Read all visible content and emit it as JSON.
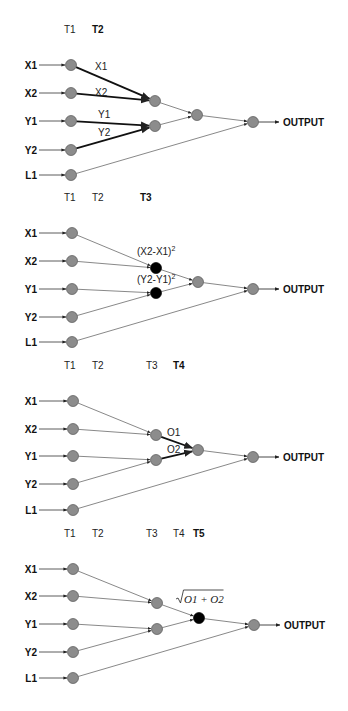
{
  "diagram": {
    "title": "",
    "colors": {
      "node_gray": "#8c8c8c",
      "node_black": "#000000",
      "edge": "#555555",
      "edge_bold": "#111111"
    },
    "input_labels": [
      "X1",
      "X2",
      "Y1",
      "Y2",
      "L1"
    ],
    "output_label": "OUTPUT",
    "panels": [
      {
        "id": "panel-1",
        "time_labels": [
          {
            "text": "T1",
            "x": 64,
            "y": 33,
            "bold": false
          },
          {
            "text": "T2",
            "x": 92,
            "y": 33,
            "bold": true
          }
        ],
        "inputs": [
          {
            "label": "X1",
            "y": 65
          },
          {
            "label": "X2",
            "y": 93
          },
          {
            "label": "Y1",
            "y": 121
          },
          {
            "label": "Y2",
            "y": 150
          },
          {
            "label": "L1",
            "y": 175
          }
        ],
        "input_node_x": 71,
        "hidden": [
          {
            "id": "h1",
            "x": 155,
            "y": 101,
            "color": "gray"
          },
          {
            "id": "h2",
            "x": 155,
            "y": 126,
            "color": "gray"
          },
          {
            "id": "h3",
            "x": 197,
            "y": 115,
            "color": "gray"
          }
        ],
        "out_node": {
          "x": 253,
          "y": 122
        },
        "edges": [
          {
            "from": "X1",
            "to": "h1",
            "bold": true,
            "label": "X1",
            "lx": 95,
            "ly": 70
          },
          {
            "from": "X2",
            "to": "h1",
            "bold": true,
            "label": "X2",
            "lx": 95,
            "ly": 96
          },
          {
            "from": "Y1",
            "to": "h2",
            "bold": true,
            "label": "Y1",
            "lx": 98,
            "ly": 118
          },
          {
            "from": "Y2",
            "to": "h2",
            "bold": true,
            "label": "Y2",
            "lx": 98,
            "ly": 136
          },
          {
            "from": "h1",
            "to": "h3",
            "bold": false
          },
          {
            "from": "h2",
            "to": "h3",
            "bold": false
          },
          {
            "from": "h3",
            "to": "OUT",
            "bold": false
          },
          {
            "from": "L1",
            "to": "OUT",
            "bold": false
          }
        ],
        "annotations": []
      },
      {
        "id": "panel-2",
        "time_labels": [
          {
            "text": "T1",
            "x": 64,
            "y": 201,
            "bold": false
          },
          {
            "text": "T2",
            "x": 92,
            "y": 201,
            "bold": false
          },
          {
            "text": "T3",
            "x": 140,
            "y": 201,
            "bold": true
          }
        ],
        "inputs": [
          {
            "label": "X1",
            "y": 233
          },
          {
            "label": "X2",
            "y": 261
          },
          {
            "label": "Y1",
            "y": 289
          },
          {
            "label": "Y2",
            "y": 317
          },
          {
            "label": "L1",
            "y": 342
          }
        ],
        "input_node_x": 72,
        "hidden": [
          {
            "id": "h1",
            "x": 156,
            "y": 268,
            "color": "black"
          },
          {
            "id": "h2",
            "x": 156,
            "y": 293,
            "color": "black"
          },
          {
            "id": "h3",
            "x": 198,
            "y": 282,
            "color": "gray"
          }
        ],
        "out_node": {
          "x": 253,
          "y": 289
        },
        "edges": [
          {
            "from": "X1",
            "to": "h1",
            "bold": false
          },
          {
            "from": "X2",
            "to": "h1",
            "bold": false
          },
          {
            "from": "Y1",
            "to": "h2",
            "bold": false
          },
          {
            "from": "Y2",
            "to": "h2",
            "bold": false
          },
          {
            "from": "h1",
            "to": "h3",
            "bold": false
          },
          {
            "from": "h2",
            "to": "h3",
            "bold": false
          },
          {
            "from": "h3",
            "to": "OUT",
            "bold": false
          },
          {
            "from": "L1",
            "to": "OUT",
            "bold": false
          }
        ],
        "annotations": [
          {
            "text": "(X2-X1)",
            "sup": "2",
            "x": 137,
            "y": 255
          },
          {
            "text": "(Y2-Y1)",
            "sup": "2",
            "x": 137,
            "y": 283
          }
        ]
      },
      {
        "id": "panel-3",
        "time_labels": [
          {
            "text": "T1",
            "x": 64,
            "y": 369,
            "bold": false
          },
          {
            "text": "T2",
            "x": 92,
            "y": 369,
            "bold": false
          },
          {
            "text": "T3",
            "x": 146,
            "y": 369,
            "bold": false
          },
          {
            "text": "T4",
            "x": 173,
            "y": 369,
            "bold": true
          }
        ],
        "inputs": [
          {
            "label": "X1",
            "y": 401
          },
          {
            "label": "X2",
            "y": 429
          },
          {
            "label": "Y1",
            "y": 456
          },
          {
            "label": "Y2",
            "y": 484
          },
          {
            "label": "L1",
            "y": 510
          }
        ],
        "input_node_x": 73,
        "hidden": [
          {
            "id": "h1",
            "x": 156,
            "y": 435,
            "color": "gray"
          },
          {
            "id": "h2",
            "x": 156,
            "y": 460,
            "color": "gray"
          },
          {
            "id": "h3",
            "x": 198,
            "y": 450,
            "color": "gray"
          }
        ],
        "out_node": {
          "x": 253,
          "y": 457
        },
        "edges": [
          {
            "from": "X1",
            "to": "h1",
            "bold": false
          },
          {
            "from": "X2",
            "to": "h1",
            "bold": false
          },
          {
            "from": "Y1",
            "to": "h2",
            "bold": false
          },
          {
            "from": "Y2",
            "to": "h2",
            "bold": false
          },
          {
            "from": "h1",
            "to": "h3",
            "bold": true,
            "label": "O1",
            "lx": 167,
            "ly": 436
          },
          {
            "from": "h2",
            "to": "h3",
            "bold": true,
            "label": "O2",
            "lx": 167,
            "ly": 453
          },
          {
            "from": "h3",
            "to": "OUT",
            "bold": false
          },
          {
            "from": "L1",
            "to": "OUT",
            "bold": false
          }
        ],
        "annotations": []
      },
      {
        "id": "panel-4",
        "time_labels": [
          {
            "text": "T1",
            "x": 64,
            "y": 537,
            "bold": false
          },
          {
            "text": "T2",
            "x": 92,
            "y": 537,
            "bold": false
          },
          {
            "text": "T3",
            "x": 146,
            "y": 537,
            "bold": false
          },
          {
            "text": "T4",
            "x": 173,
            "y": 537,
            "bold": false
          },
          {
            "text": "T5",
            "x": 193,
            "y": 537,
            "bold": true
          }
        ],
        "inputs": [
          {
            "label": "X1",
            "y": 569
          },
          {
            "label": "X2",
            "y": 596
          },
          {
            "label": "Y1",
            "y": 624
          },
          {
            "label": "Y2",
            "y": 652
          },
          {
            "label": "L1",
            "y": 678
          }
        ],
        "input_node_x": 73,
        "hidden": [
          {
            "id": "h1",
            "x": 157,
            "y": 603,
            "color": "gray"
          },
          {
            "id": "h2",
            "x": 157,
            "y": 629,
            "color": "gray"
          },
          {
            "id": "h3",
            "x": 199,
            "y": 618,
            "color": "black"
          }
        ],
        "out_node": {
          "x": 254,
          "y": 625
        },
        "edges": [
          {
            "from": "X1",
            "to": "h1",
            "bold": false
          },
          {
            "from": "X2",
            "to": "h1",
            "bold": false
          },
          {
            "from": "Y1",
            "to": "h2",
            "bold": false
          },
          {
            "from": "Y2",
            "to": "h2",
            "bold": false
          },
          {
            "from": "h1",
            "to": "h3",
            "bold": false
          },
          {
            "from": "h2",
            "to": "h3",
            "bold": false
          },
          {
            "from": "h3",
            "to": "OUT",
            "bold": false
          },
          {
            "from": "L1",
            "to": "OUT",
            "bold": false
          }
        ],
        "annotations": [
          {
            "text": "O1 + O2",
            "sqrt": true,
            "x": 176,
            "y": 603
          }
        ]
      }
    ]
  }
}
